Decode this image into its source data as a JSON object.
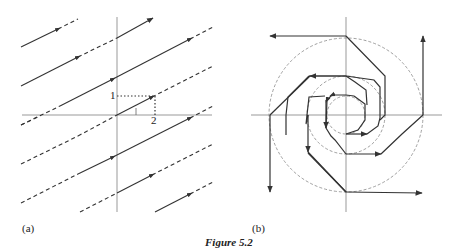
{
  "figure": {
    "caption": "Figure 5.2",
    "panels": [
      {
        "id": "a",
        "label": "(a)",
        "description": "Family of parallel directed lines of slope 1/2 with dashed continuations; dotted construction showing run 2 and rise 1",
        "axis_color": "#909090",
        "line_color": "#333333",
        "annotations": {
          "rise_label": "1",
          "run_label": "2"
        }
      },
      {
        "id": "b",
        "label": "(b)",
        "description": "Octagonal spiral trajectory with arrows around three dashed concentric circles centered at origin",
        "axis_color": "#909090",
        "line_color": "#333333",
        "circle_color": "#888888"
      }
    ]
  }
}
